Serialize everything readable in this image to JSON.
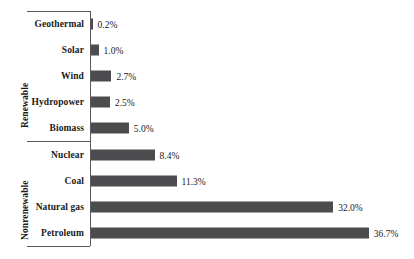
{
  "chart_data": {
    "type": "bar",
    "orientation": "horizontal",
    "title": "",
    "subtitle": "",
    "xlabel": "",
    "ylabel": "",
    "grid": false,
    "legend": null,
    "xlim": [
      0,
      36.7
    ],
    "unit": "%",
    "categories": [
      "Geothermal",
      "Solar",
      "Wind",
      "Hydropower",
      "Biomass",
      "Nuclear",
      "Coal",
      "Natural gas",
      "Petroleum"
    ],
    "values": [
      0.2,
      1.0,
      2.7,
      2.5,
      5.0,
      8.4,
      11.3,
      32.0,
      36.7
    ],
    "data_labels": [
      "0.2%",
      "1.0%",
      "2.7%",
      "2.5%",
      "5.0%",
      "8.4%",
      "11.3%",
      "32.0%",
      "36.7%"
    ],
    "groups": [
      {
        "label": "Renewable",
        "categories": [
          "Geothermal",
          "Solar",
          "Wind",
          "Hydropower",
          "Biomass"
        ]
      },
      {
        "label": "Nonrenewable",
        "categories": [
          "Nuclear",
          "Coal",
          "Natural gas",
          "Petroleum"
        ]
      }
    ],
    "bar_color": "#4c4c4e",
    "axis_color": "#58585a",
    "background_color": "#ffffff"
  },
  "rows": [
    {
      "category": "Geothermal",
      "value": 0.2,
      "label": "0.2%",
      "group": "Renewable"
    },
    {
      "category": "Solar",
      "value": 1.0,
      "label": "1.0%",
      "group": "Renewable"
    },
    {
      "category": "Wind",
      "value": 2.7,
      "label": "2.7%",
      "group": "Renewable"
    },
    {
      "category": "Hydropower",
      "value": 2.5,
      "label": "2.5%",
      "group": "Renewable"
    },
    {
      "category": "Biomass",
      "value": 5.0,
      "label": "5.0%",
      "group": "Renewable"
    },
    {
      "category": "Nuclear",
      "value": 8.4,
      "label": "8.4%",
      "group": "Nonrenewable"
    },
    {
      "category": "Coal",
      "value": 11.3,
      "label": "11.3%",
      "group": "Nonrenewable"
    },
    {
      "category": "Natural gas",
      "value": 32.0,
      "label": "32.0%",
      "group": "Nonrenewable"
    },
    {
      "category": "Petroleum",
      "value": 36.7,
      "label": "36.7%",
      "group": "Nonrenewable"
    }
  ],
  "groups": {
    "renewable_label": "Renewable",
    "nonrenewable_label": "Nonrenewable"
  }
}
